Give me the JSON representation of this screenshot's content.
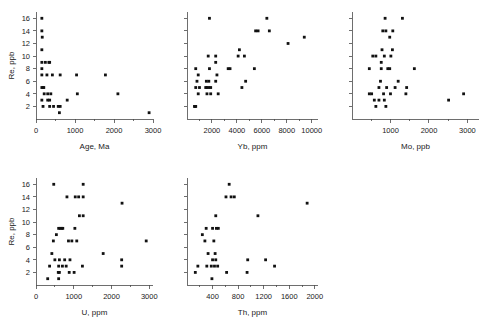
{
  "figure": {
    "background": "#ffffff",
    "marker_color": "#111111",
    "axis_color": "#4a4a4a",
    "panel_count": 5,
    "layout": "2 rows: 3 panels top, 2 panels bottom"
  },
  "chart_data": [
    {
      "type": "scatter",
      "title": "",
      "xlabel": "Age, Ma",
      "ylabel": "Re, ppb",
      "xlim": [
        0,
        3000
      ],
      "ylim": [
        0,
        17
      ],
      "xticks": [
        0,
        1000,
        2000,
        3000
      ],
      "xticklabels": [
        "0",
        "1000",
        "2000",
        "3000"
      ],
      "xminorticks": [
        500,
        1500,
        2500
      ],
      "yticks": [
        2,
        4,
        6,
        8,
        10,
        12,
        14,
        16
      ],
      "yticklabels": [
        "2",
        "4",
        "6",
        "8",
        "10",
        "12",
        "14",
        "16"
      ],
      "grid": false,
      "legend": null,
      "points": [
        [
          150,
          16
        ],
        [
          150,
          14
        ],
        [
          160,
          13
        ],
        [
          150,
          11
        ],
        [
          150,
          9
        ],
        [
          240,
          9
        ],
        [
          330,
          9
        ],
        [
          350,
          9
        ],
        [
          150,
          8
        ],
        [
          150,
          7
        ],
        [
          280,
          7
        ],
        [
          420,
          7
        ],
        [
          620,
          7
        ],
        [
          1040,
          7
        ],
        [
          1780,
          7
        ],
        [
          150,
          5
        ],
        [
          180,
          5
        ],
        [
          200,
          5
        ],
        [
          210,
          4
        ],
        [
          300,
          4
        ],
        [
          380,
          4
        ],
        [
          1060,
          4
        ],
        [
          2100,
          4
        ],
        [
          150,
          3
        ],
        [
          300,
          3
        ],
        [
          350,
          3
        ],
        [
          800,
          3
        ],
        [
          180,
          2
        ],
        [
          350,
          2
        ],
        [
          450,
          2
        ],
        [
          570,
          2
        ],
        [
          620,
          2
        ],
        [
          600,
          1
        ],
        [
          2900,
          1
        ]
      ]
    },
    {
      "type": "scatter",
      "title": "",
      "xlabel": "Yb, ppm",
      "ylabel": "",
      "xlim": [
        0,
        10500
      ],
      "ylim": [
        0,
        17
      ],
      "xticks": [
        2000,
        4000,
        6000,
        8000,
        10000
      ],
      "xticklabels": [
        "2000",
        "4000",
        "6000",
        "8000",
        "10000"
      ],
      "xminorticks": [
        1000,
        3000,
        5000,
        7000,
        9000
      ],
      "yticks": [
        2,
        4,
        6,
        8,
        10,
        12,
        14,
        16
      ],
      "yticklabels": [],
      "grid": false,
      "legend": null,
      "points": [
        [
          1800,
          16
        ],
        [
          6400,
          16
        ],
        [
          5500,
          14
        ],
        [
          5700,
          14
        ],
        [
          6600,
          14
        ],
        [
          9400,
          13
        ],
        [
          8100,
          12
        ],
        [
          4200,
          11
        ],
        [
          1700,
          10
        ],
        [
          2300,
          10
        ],
        [
          4100,
          10
        ],
        [
          4600,
          10
        ],
        [
          2300,
          9
        ],
        [
          700,
          8
        ],
        [
          1800,
          8
        ],
        [
          3300,
          8
        ],
        [
          3450,
          8
        ],
        [
          5400,
          8
        ],
        [
          900,
          7
        ],
        [
          2400,
          7
        ],
        [
          800,
          6
        ],
        [
          1550,
          6
        ],
        [
          1750,
          6
        ],
        [
          2300,
          6
        ],
        [
          4700,
          6
        ],
        [
          700,
          5
        ],
        [
          1000,
          5
        ],
        [
          1500,
          5
        ],
        [
          1600,
          5
        ],
        [
          1750,
          5
        ],
        [
          1900,
          5
        ],
        [
          4400,
          5
        ],
        [
          900,
          4
        ],
        [
          1600,
          4
        ],
        [
          1900,
          4
        ],
        [
          2500,
          4
        ],
        [
          600,
          2
        ],
        [
          650,
          2
        ],
        [
          700,
          2
        ]
      ]
    },
    {
      "type": "scatter",
      "title": "",
      "xlabel": "Mo, ppb",
      "ylabel": "",
      "xlim": [
        0,
        3300
      ],
      "ylim": [
        0,
        17
      ],
      "xticks": [
        1000,
        2000,
        3000
      ],
      "xticklabels": [
        "1000",
        "2000",
        "3000"
      ],
      "xminorticks": [
        500,
        1500,
        2500
      ],
      "yticks": [
        2,
        4,
        6,
        8,
        10,
        12,
        14,
        16
      ],
      "yticklabels": [],
      "grid": false,
      "legend": null,
      "points": [
        [
          860,
          16
        ],
        [
          1310,
          16
        ],
        [
          800,
          14
        ],
        [
          880,
          14
        ],
        [
          1060,
          14
        ],
        [
          980,
          13
        ],
        [
          780,
          11
        ],
        [
          1050,
          11
        ],
        [
          540,
          10
        ],
        [
          620,
          10
        ],
        [
          840,
          10
        ],
        [
          1010,
          10
        ],
        [
          760,
          9
        ],
        [
          450,
          8
        ],
        [
          760,
          8
        ],
        [
          930,
          8
        ],
        [
          980,
          8
        ],
        [
          1620,
          8
        ],
        [
          740,
          6
        ],
        [
          1200,
          6
        ],
        [
          700,
          5
        ],
        [
          900,
          5
        ],
        [
          1120,
          5
        ],
        [
          1420,
          5
        ],
        [
          450,
          4
        ],
        [
          510,
          4
        ],
        [
          820,
          4
        ],
        [
          1000,
          4
        ],
        [
          1400,
          4
        ],
        [
          580,
          3
        ],
        [
          700,
          3
        ],
        [
          840,
          3
        ],
        [
          620,
          2
        ],
        [
          880,
          2
        ],
        [
          2510,
          3
        ],
        [
          2900,
          4
        ]
      ]
    },
    {
      "type": "scatter",
      "title": "",
      "xlabel": "U, ppm",
      "ylabel": "Re, ppb",
      "xlim": [
        0,
        3100
      ],
      "ylim": [
        0,
        17
      ],
      "xticks": [
        0,
        1000,
        2000,
        3000
      ],
      "xticklabels": [
        "0",
        "1000",
        "2000",
        "3000"
      ],
      "xminorticks": [
        500,
        1500,
        2500
      ],
      "yticks": [
        2,
        4,
        6,
        8,
        10,
        12,
        14,
        16
      ],
      "yticklabels": [
        "2",
        "4",
        "6",
        "8",
        "10",
        "12",
        "14",
        "16"
      ],
      "grid": false,
      "legend": null,
      "points": [
        [
          470,
          16
        ],
        [
          1250,
          16
        ],
        [
          820,
          14
        ],
        [
          1040,
          14
        ],
        [
          1130,
          14
        ],
        [
          1250,
          14
        ],
        [
          2280,
          13
        ],
        [
          1150,
          11
        ],
        [
          1250,
          11
        ],
        [
          600,
          9
        ],
        [
          640,
          9
        ],
        [
          680,
          9
        ],
        [
          710,
          9
        ],
        [
          1030,
          9
        ],
        [
          540,
          8
        ],
        [
          460,
          7
        ],
        [
          860,
          7
        ],
        [
          950,
          7
        ],
        [
          1080,
          7
        ],
        [
          2920,
          7
        ],
        [
          1780,
          5
        ],
        [
          420,
          5
        ],
        [
          500,
          4
        ],
        [
          620,
          4
        ],
        [
          760,
          4
        ],
        [
          900,
          4
        ],
        [
          2270,
          4
        ],
        [
          360,
          3
        ],
        [
          600,
          3
        ],
        [
          700,
          3
        ],
        [
          800,
          3
        ],
        [
          1230,
          3
        ],
        [
          2270,
          3
        ],
        [
          590,
          2
        ],
        [
          620,
          2
        ],
        [
          880,
          2
        ],
        [
          1010,
          2
        ],
        [
          310,
          1
        ],
        [
          600,
          1
        ]
      ]
    },
    {
      "type": "scatter",
      "title": "",
      "xlabel": "Th, ppm",
      "ylabel": "",
      "xlim": [
        0,
        2050
      ],
      "ylim": [
        0,
        17
      ],
      "xticks": [
        400,
        800,
        1200,
        1600,
        2000
      ],
      "xticklabels": [
        "400",
        "800",
        "1200",
        "1600",
        "2000"
      ],
      "xminorticks": [
        200,
        600,
        1000,
        1400,
        1800
      ],
      "yticks": [
        2,
        4,
        6,
        8,
        10,
        12,
        14,
        16
      ],
      "yticklabels": [],
      "grid": false,
      "legend": null,
      "points": [
        [
          660,
          16
        ],
        [
          610,
          14
        ],
        [
          690,
          14
        ],
        [
          740,
          14
        ],
        [
          1880,
          13
        ],
        [
          450,
          11
        ],
        [
          1110,
          11
        ],
        [
          300,
          9
        ],
        [
          400,
          9
        ],
        [
          460,
          9
        ],
        [
          490,
          9
        ],
        [
          240,
          8
        ],
        [
          280,
          7
        ],
        [
          420,
          7
        ],
        [
          330,
          5
        ],
        [
          440,
          5
        ],
        [
          400,
          4
        ],
        [
          450,
          4
        ],
        [
          950,
          4
        ],
        [
          1230,
          4
        ],
        [
          170,
          3
        ],
        [
          310,
          3
        ],
        [
          380,
          3
        ],
        [
          430,
          3
        ],
        [
          480,
          3
        ],
        [
          1370,
          3
        ],
        [
          130,
          2
        ],
        [
          620,
          2
        ],
        [
          940,
          2
        ],
        [
          390,
          1
        ]
      ]
    }
  ]
}
